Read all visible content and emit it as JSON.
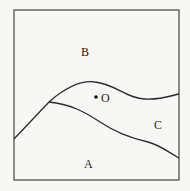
{
  "diagram": {
    "labels": {
      "region_a": "A",
      "region_b": "B",
      "region_c": "C",
      "point_o": "O"
    },
    "colors": {
      "line": "#2a2a2a",
      "background": "#f7f7f5",
      "frame": "#444444"
    }
  }
}
